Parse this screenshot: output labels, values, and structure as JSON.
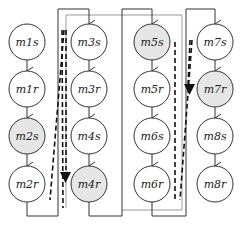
{
  "diagram": {
    "nodes": [
      {
        "id": "m1s",
        "label": "m1s",
        "col": 0,
        "row": 0,
        "shaded": false
      },
      {
        "id": "m1r",
        "label": "m1r",
        "col": 0,
        "row": 1,
        "shaded": false
      },
      {
        "id": "m2s",
        "label": "m2s",
        "col": 0,
        "row": 2,
        "shaded": true
      },
      {
        "id": "m2r",
        "label": "m2r",
        "col": 0,
        "row": 3,
        "shaded": false
      },
      {
        "id": "m3s",
        "label": "m3s",
        "col": 1,
        "row": 0,
        "shaded": false
      },
      {
        "id": "m3r",
        "label": "m3r",
        "col": 1,
        "row": 1,
        "shaded": false
      },
      {
        "id": "m4s",
        "label": "m4s",
        "col": 1,
        "row": 2,
        "shaded": false
      },
      {
        "id": "m4r",
        "label": "m4r",
        "col": 1,
        "row": 3,
        "shaded": true
      },
      {
        "id": "m5s",
        "label": "m5s",
        "col": 2,
        "row": 0,
        "shaded": true
      },
      {
        "id": "m5r",
        "label": "m5r",
        "col": 2,
        "row": 1,
        "shaded": false
      },
      {
        "id": "m6s",
        "label": "m6s",
        "col": 2,
        "row": 2,
        "shaded": false
      },
      {
        "id": "m6r",
        "label": "m6r",
        "col": 2,
        "row": 3,
        "shaded": false
      },
      {
        "id": "m7s",
        "label": "m7s",
        "col": 3,
        "row": 0,
        "shaded": false
      },
      {
        "id": "m7r",
        "label": "m7r",
        "col": 3,
        "row": 1,
        "shaded": true
      },
      {
        "id": "m8s",
        "label": "m8s",
        "col": 3,
        "row": 2,
        "shaded": false
      },
      {
        "id": "m8r",
        "label": "m8r",
        "col": 3,
        "row": 3,
        "shaded": false
      }
    ],
    "colors": {
      "shaded_fill": "#e6e6e6",
      "plain_fill": "#ffffff",
      "stroke": "#333333",
      "gray_line": "#999999"
    }
  }
}
